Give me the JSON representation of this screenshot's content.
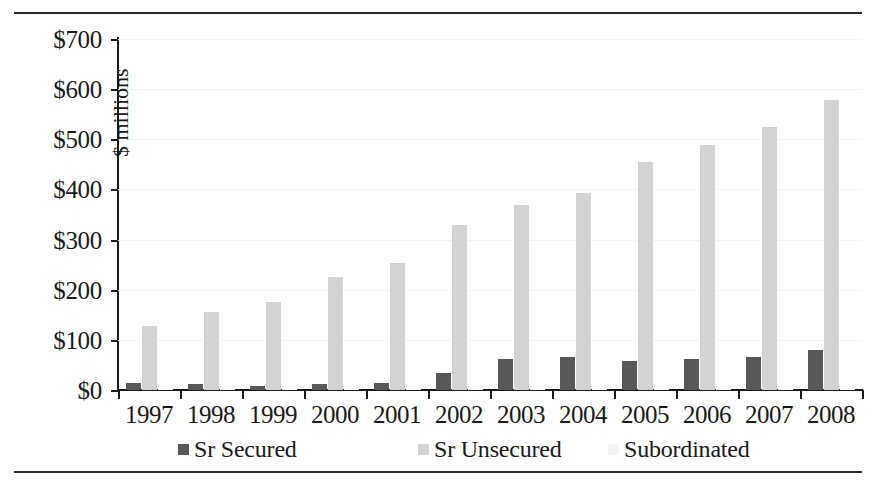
{
  "chart_data": {
    "type": "bar",
    "title": "",
    "subtitle": "",
    "xlabel": "",
    "ylabel": "$ millions",
    "categories": [
      "1997",
      "1998",
      "1999",
      "2000",
      "2001",
      "2002",
      "2003",
      "2004",
      "2005",
      "2006",
      "2007",
      "2008"
    ],
    "series": [
      {
        "name": "Sr Secured",
        "color": "#585858",
        "values": [
          13,
          11,
          8,
          11,
          13,
          34,
          61,
          66,
          57,
          61,
          66,
          79
        ]
      },
      {
        "name": "Sr Unsecured",
        "color": "#d3d3d3",
        "values": [
          128,
          155,
          176,
          226,
          253,
          330,
          368,
          392,
          454,
          489,
          525,
          579
        ]
      },
      {
        "name": "Subordinated",
        "color": "#fbfbfb",
        "values": [
          2,
          2,
          2,
          2,
          2,
          2,
          2,
          2,
          2,
          2,
          2,
          2
        ]
      }
    ],
    "ylim": [
      0,
      700
    ],
    "ytick_values": [
      0,
      100,
      200,
      300,
      400,
      500,
      600,
      700
    ],
    "ytick_labels": [
      "$0",
      "$100",
      "$200",
      "$300",
      "$400",
      "$500",
      "$600",
      "$700"
    ],
    "grid": true,
    "grid_axis": "y",
    "legend_position": "bottom"
  },
  "legend": {
    "items": [
      {
        "label": "Sr Secured",
        "swatch": "secured"
      },
      {
        "label": "Sr Unsecured",
        "swatch": "unsecured"
      },
      {
        "label": "Subordinated",
        "swatch": "subordinated"
      }
    ]
  }
}
